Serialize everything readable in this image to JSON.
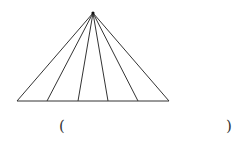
{
  "diagram": {
    "type": "triangle-fan",
    "apex": [
      93,
      13
    ],
    "base_y": 101,
    "base_points_x": [
      17,
      47,
      78,
      108,
      138,
      169
    ],
    "line_color": "#333333"
  },
  "answer_blank": {
    "open": "(",
    "close": ")"
  }
}
